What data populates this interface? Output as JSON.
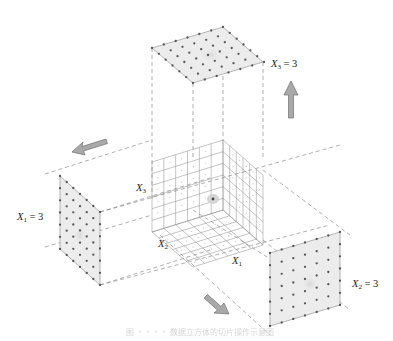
{
  "diagram": {
    "type": "3d-grid-slicing-illustration",
    "central_grid": {
      "description": "6x6x6 cube grid with axes",
      "axes": [
        {
          "name": "X1",
          "label_main": "X",
          "label_sub": "1"
        },
        {
          "name": "X2",
          "label_main": "X",
          "label_sub": "2"
        },
        {
          "name": "X3",
          "label_main": "X",
          "label_sub": "3"
        }
      ],
      "divisions": 6
    },
    "slices": [
      {
        "id": "top",
        "label_main": "X",
        "label_sub": "3",
        "label_eq": " = 3",
        "direction": "up"
      },
      {
        "id": "left",
        "label_main": "X",
        "label_sub": "1",
        "label_eq": " = 3",
        "direction": "left"
      },
      {
        "id": "right",
        "label_main": "X",
        "label_sub": "2",
        "label_eq": " = 3",
        "direction": "down-right"
      }
    ],
    "colors": {
      "panel_fill": "#ececec",
      "dot": "#555555",
      "arrow_fill": "#a9a9a9",
      "arrow_stroke": "#6f6f6f",
      "dash": "#777777",
      "grid": "#8a8a8a"
    },
    "caption": "图 ・・・・ 数据立方体的切片操作示意图"
  }
}
